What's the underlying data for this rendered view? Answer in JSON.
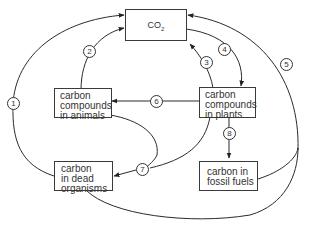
{
  "diagram": {
    "nodes": {
      "co2": {
        "label": "CO",
        "subscript": "2"
      },
      "animals": {
        "lines": [
          "carbon",
          "compounds",
          "in animals"
        ]
      },
      "plants": {
        "lines": [
          "carbon",
          "compounds",
          "in plants"
        ]
      },
      "dead": {
        "lines": [
          "carbon",
          "in dead",
          "organisms"
        ]
      },
      "fossil": {
        "lines": [
          "carbon in",
          "fossil fuels"
        ]
      }
    },
    "arrows": [
      {
        "number": "1",
        "from": "carbon in dead organisms",
        "to": "CO2"
      },
      {
        "number": "2",
        "from": "carbon compounds in animals",
        "to": "CO2"
      },
      {
        "number": "3",
        "from": "carbon compounds in plants",
        "to": "CO2"
      },
      {
        "number": "4",
        "from": "CO2",
        "to": "carbon compounds in plants"
      },
      {
        "number": "5",
        "from": "carbon in fossil fuels / dead organisms",
        "to": "CO2"
      },
      {
        "number": "6",
        "from": "carbon compounds in plants",
        "to": "carbon compounds in animals"
      },
      {
        "number": "7",
        "from": "carbon compounds in animals / plants",
        "to": "carbon in dead organisms"
      },
      {
        "number": "8",
        "from": "carbon compounds in plants",
        "to": "carbon in fossil fuels"
      }
    ],
    "colors": {
      "line": "#2b2b2b",
      "text": "#333333",
      "background": "#ffffff"
    }
  }
}
